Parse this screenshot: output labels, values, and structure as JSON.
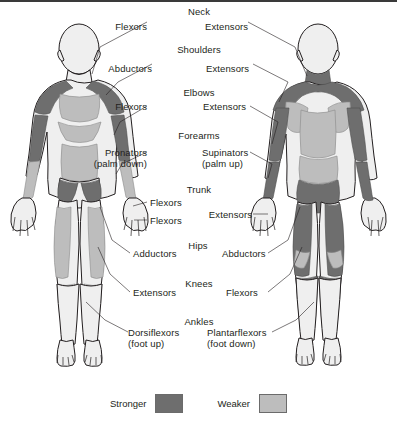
{
  "figure": {
    "colors": {
      "stronger": "#6e6e6e",
      "weaker": "#bdbdbd",
      "skin": "#efefef",
      "outline": "#231f20",
      "text": "#231f20",
      "background": "#ffffff"
    }
  },
  "labels": {
    "neck": {
      "group": "Neck",
      "left": "Flexors",
      "right": "Extensors"
    },
    "shoulders": {
      "group": "Shoulders",
      "left": "Abductors",
      "right": "Extensors"
    },
    "elbows": {
      "group": "Elbows",
      "left": "Flexors",
      "right": "Extensors"
    },
    "forearms": {
      "group": "Forearms",
      "left": "Pronators",
      "left_sub": "(palm down)",
      "right": "Supinators",
      "right_sub": "(palm up)"
    },
    "trunk": {
      "group": "Trunk",
      "left": "Flexors",
      "left_second": "Flexors",
      "right": "Extensors"
    },
    "hips": {
      "group": "Hips",
      "left": "Adductors",
      "right": "Abductors"
    },
    "knees": {
      "group": "Knees",
      "left": "Extensors",
      "right": "Flexors"
    },
    "ankles": {
      "group": "Ankles",
      "left": "Dorsiflexors",
      "left_sub": "(foot up)",
      "right": "Plantarflexors",
      "right_sub": "(foot down)"
    }
  },
  "legend": {
    "items": [
      {
        "label": "Stronger",
        "color": "#6e6e6e"
      },
      {
        "label": "Weaker",
        "color": "#bdbdbd"
      }
    ]
  }
}
